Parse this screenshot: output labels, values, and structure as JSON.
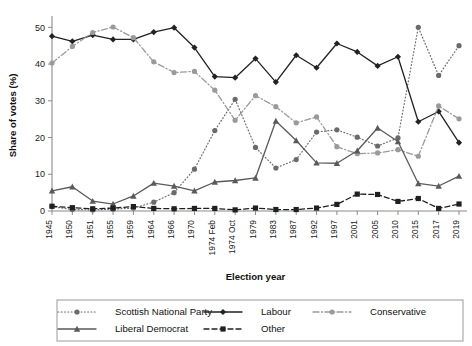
{
  "chart_data": {
    "type": "line",
    "title": "",
    "xlabel": "Election year",
    "ylabel": "Share of votes (%)",
    "ylim": [
      0,
      52
    ],
    "yticks": [
      0,
      10,
      20,
      30,
      40,
      50
    ],
    "grid": false,
    "legend_position": "bottom",
    "categories": [
      "1945",
      "1950",
      "1951",
      "1955",
      "1959",
      "1964",
      "1966",
      "1970",
      "1974 Feb",
      "1974 Oct",
      "1979",
      "1983",
      "1987",
      "1992",
      "1997",
      "2001",
      "2005",
      "2010",
      "2015",
      "2017",
      "2019"
    ],
    "series": [
      {
        "name": "Scottish National Party",
        "color": "#6b6b6b",
        "line_style": "dotted",
        "marker": "circle",
        "values": [
          1.2,
          0.4,
          0.3,
          0.5,
          0.8,
          2.4,
          5.0,
          11.4,
          21.9,
          30.4,
          17.3,
          11.7,
          14.0,
          21.5,
          22.1,
          20.1,
          17.7,
          19.9,
          50.0,
          36.9,
          45.0
        ]
      },
      {
        "name": "Labour",
        "color": "#222222",
        "line_style": "solid",
        "marker": "diamond",
        "values": [
          47.6,
          46.2,
          47.9,
          46.7,
          46.7,
          48.7,
          49.9,
          44.5,
          36.6,
          36.3,
          41.5,
          35.1,
          42.4,
          39.0,
          45.6,
          43.3,
          39.5,
          42.0,
          24.3,
          27.1,
          18.6
        ]
      },
      {
        "name": "Conservative",
        "color": "#9a9a9a",
        "line_style": "dashdot",
        "marker": "circle",
        "values": [
          40.3,
          44.8,
          48.6,
          50.1,
          47.2,
          40.6,
          37.7,
          38.0,
          32.9,
          24.7,
          31.4,
          28.4,
          24.0,
          25.6,
          17.5,
          15.6,
          15.8,
          16.7,
          14.9,
          28.6,
          25.1
        ]
      },
      {
        "name": "Liberal Democrat",
        "color": "#5a5a5a",
        "line_style": "solid",
        "marker": "triangle",
        "values": [
          5.5,
          6.6,
          2.7,
          1.9,
          4.1,
          7.6,
          6.8,
          5.5,
          7.9,
          8.3,
          9.0,
          24.5,
          19.2,
          13.1,
          13.0,
          16.4,
          22.6,
          18.9,
          7.5,
          6.8,
          9.5
        ]
      },
      {
        "name": "Other",
        "color": "#1f1f1f",
        "line_style": "dashed",
        "marker": "square",
        "values": [
          1.3,
          0.9,
          0.6,
          0.8,
          1.2,
          0.7,
          0.6,
          0.7,
          0.7,
          0.3,
          0.8,
          0.4,
          0.4,
          0.8,
          1.8,
          4.6,
          4.5,
          2.6,
          3.4,
          0.7,
          1.9
        ]
      }
    ]
  },
  "legend": {
    "items": [
      {
        "label": "Scottish National Party"
      },
      {
        "label": "Labour"
      },
      {
        "label": "Conservative"
      },
      {
        "label": "Liberal Democrat"
      },
      {
        "label": "Other"
      }
    ]
  }
}
